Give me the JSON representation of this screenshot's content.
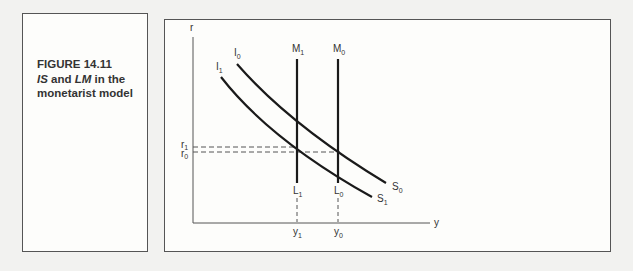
{
  "caption": {
    "figure_label": "FIGURE 14.11",
    "title_part1": "IS",
    "title_and": " and ",
    "title_part2": "LM",
    "title_rest": " in the monetarist model"
  },
  "diagram": {
    "y_axis_label": "r",
    "x_axis_label": "y",
    "curves": [
      {
        "name": "I0-S0",
        "start_label": "I",
        "start_sub": "0",
        "end_label": "S",
        "end_sub": "0"
      },
      {
        "name": "I1-S1",
        "start_label": "I",
        "start_sub": "1",
        "end_label": "S",
        "end_sub": "1"
      },
      {
        "name": "M1-L1",
        "top_label": "M",
        "top_sub": "1",
        "bottom_label": "L",
        "bottom_sub": "1"
      },
      {
        "name": "M0-L0",
        "top_label": "M",
        "top_sub": "0",
        "bottom_label": "L",
        "bottom_sub": "0"
      }
    ],
    "r_ticks": [
      {
        "label": "r",
        "sub": "1"
      },
      {
        "label": "r",
        "sub": "0"
      }
    ],
    "y_ticks": [
      {
        "label": "y",
        "sub": "1"
      },
      {
        "label": "y",
        "sub": "0"
      }
    ],
    "colors": {
      "line": "#1a1a1a",
      "axis": "#555555",
      "text": "#333333"
    }
  }
}
